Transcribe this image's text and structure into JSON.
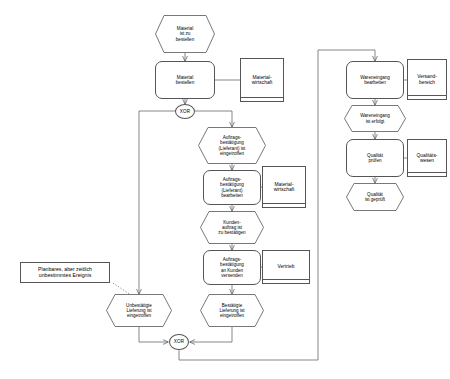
{
  "diagram": {
    "stroke_color": "#555555",
    "text_color": "#000000",
    "background": "#ffffff"
  },
  "nodes": {
    "event_material_zu_bestellen": {
      "label": "Material\nist zu\nbestellen",
      "type": "event"
    },
    "function_material_bestellen": {
      "label": "Material\nbestellen",
      "type": "function"
    },
    "org_materialwirtschaft_top": {
      "label": "Material-\nwirtschaft",
      "type": "organization"
    },
    "connector_xor_top": {
      "label": "XOR",
      "type": "connector"
    },
    "event_auftragsbestaetigung_eingetroffen": {
      "label": "Auftrags-\nbestätigung\n(Lieferant) ist\neingetroffen",
      "type": "event"
    },
    "function_auftragsbestaetigung_bearbeiten": {
      "label": "Auftrags-\nbestätigung\n(Lieferant)\nbearbeiten",
      "type": "function"
    },
    "org_materialwirtschaft_mid": {
      "label": "Material-\nwirtschaft",
      "type": "organization"
    },
    "event_kundenauftrag_zu_bestaetigen": {
      "label": "Kunden-\nauftrag ist\nzu bestätigen",
      "type": "event"
    },
    "function_auftragsbestaetigung_versenden": {
      "label": "Auftrags-\nbestätigung\nan Kunden\nversenden",
      "type": "function"
    },
    "org_vertrieb": {
      "label": "Vertrieb",
      "type": "organization"
    },
    "event_unbestaetigte_lieferung": {
      "label": "Unbestätigte\nLieferung ist\neingetroffen",
      "type": "event"
    },
    "event_bestaetigte_lieferung": {
      "label": "Bestätigte\nLieferung ist\neingetroffen",
      "type": "event"
    },
    "connector_xor_bottom": {
      "label": "XOR",
      "type": "connector"
    },
    "function_wareneingang_bearbeiten": {
      "label": "Wareneingang\nbearbeiten",
      "type": "function"
    },
    "org_versandbereich": {
      "label": "Versand-\nbereich",
      "type": "organization"
    },
    "event_wareneingang_erfolgt": {
      "label": "Wareneingang\nist erfolgt",
      "type": "event"
    },
    "function_qualitaet_pruefen": {
      "label": "Qualität\nprüfen",
      "type": "function"
    },
    "org_qualitaetswesen": {
      "label": "Qualitäts-\nwesen",
      "type": "organization"
    },
    "event_qualitaet_geprueft": {
      "label": "Qualität\nist geprüft",
      "type": "event"
    },
    "note_planbares_ereignis": {
      "label": "Planbares, aber zeitlich\nunbestimmtes Ereignis",
      "type": "note"
    }
  }
}
